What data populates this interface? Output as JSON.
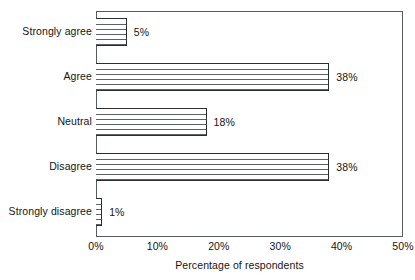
{
  "chart_data": {
    "type": "bar",
    "orientation": "horizontal",
    "title": "",
    "subtitle": "",
    "xlabel": "Percentage of respondents",
    "ylabel": "",
    "categories": [
      "Strongly agree",
      "Agree",
      "Neutral",
      "Disagree",
      "Strongly disagree"
    ],
    "values": [
      5,
      38,
      18,
      38,
      1
    ],
    "value_labels": [
      "5%",
      "38%",
      "18%",
      "38%",
      "1%"
    ],
    "xlim": [
      0,
      50
    ],
    "xticks": [
      0,
      10,
      20,
      30,
      40,
      50
    ],
    "xtick_labels": [
      "0%",
      "10%",
      "20%",
      "30%",
      "40%",
      "50%"
    ],
    "grid": false,
    "legend": null,
    "bar_fill": "horizontal-line-hatch",
    "colors": {
      "bar_fill": "#ffffff",
      "bar_hatch": "#5a6264",
      "bar_outline": "#2b2f31",
      "axis": "#555c5e",
      "text": "#141414",
      "background": "#ffffff"
    }
  },
  "bars": [
    {
      "label": "Strongly agree",
      "value": 5,
      "value_label": "5%"
    },
    {
      "label": "Agree",
      "value": 38,
      "value_label": "38%"
    },
    {
      "label": "Neutral",
      "value": 18,
      "value_label": "18%"
    },
    {
      "label": "Disagree",
      "value": 38,
      "value_label": "38%"
    },
    {
      "label": "Strongly disagree",
      "value": 1,
      "value_label": "1%"
    }
  ],
  "axis": {
    "x_title": "Percentage of respondents",
    "ticks": [
      {
        "value": 0,
        "label": "0%"
      },
      {
        "value": 10,
        "label": "10%"
      },
      {
        "value": 20,
        "label": "20%"
      },
      {
        "value": 30,
        "label": "30%"
      },
      {
        "value": 40,
        "label": "40%"
      },
      {
        "value": 50,
        "label": "50%"
      }
    ]
  }
}
